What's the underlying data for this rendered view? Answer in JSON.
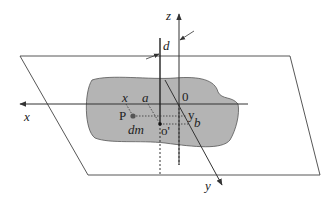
{
  "diagram": {
    "type": "parallel-axis-theorem-lamina",
    "labels": {
      "z_axis": "z",
      "x_axis": "x",
      "y_axis": "y",
      "distance": "d",
      "origin": "0",
      "x_coord": "x",
      "a_coord": "a",
      "y_coord": "y",
      "b_coord": "b",
      "point": "P",
      "mass_element": "dm",
      "center": "o'"
    },
    "colors": {
      "lamina_fill": "#b4b4b4",
      "line": "#333333",
      "background": "#ffffff"
    }
  }
}
